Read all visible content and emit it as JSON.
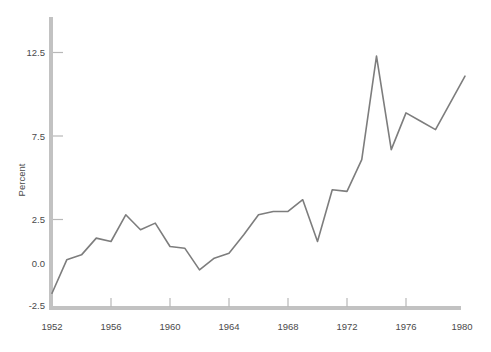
{
  "chart_data": {
    "type": "line",
    "title": "",
    "subtitle": "",
    "xlabel": "",
    "ylabel": "Percent",
    "xlim": [
      1952,
      1981
    ],
    "ylim": [
      -2.5,
      14.2
    ],
    "grid": false,
    "legend": false,
    "legend_position": "none",
    "x_ticks": [
      1952,
      1956,
      1960,
      1964,
      1968,
      1972,
      1976,
      1980
    ],
    "x_tick_labels": [
      "1952",
      "1956",
      "1960",
      "1964",
      "1968",
      "1972",
      "1976",
      "1980"
    ],
    "y_ticks": [
      -2.5,
      0.0,
      2.5,
      7.5,
      12.5
    ],
    "y_tick_labels": [
      "-2.5",
      "0.0",
      "2.5",
      "7.5",
      "12.5"
    ],
    "series": [
      {
        "name": "Percent",
        "color": "#7d7d7d",
        "x": [
          1952,
          1953,
          1954,
          1955,
          1956,
          1957,
          1958,
          1959,
          1960,
          1961,
          1962,
          1963,
          1964,
          1965,
          1966,
          1967,
          1968,
          1969,
          1970,
          1971,
          1972,
          1973,
          1974,
          1975,
          1976,
          1977,
          1978,
          1979,
          1980
        ],
        "values": [
          -1.8,
          0.2,
          0.5,
          1.5,
          1.3,
          2.9,
          2.0,
          2.4,
          1.0,
          0.9,
          -0.4,
          0.3,
          0.6,
          1.7,
          2.9,
          3.1,
          3.1,
          3.8,
          1.3,
          4.4,
          4.3,
          6.2,
          12.4,
          6.8,
          9.0,
          8.5,
          8.0,
          9.6,
          11.2
        ]
      }
    ]
  },
  "axis": {
    "ylabel": "Percent",
    "y_tick_labels": [
      "12.5",
      "7.5",
      "2.5",
      "0.0",
      "-2.5"
    ],
    "x_tick_labels": [
      "1952",
      "1956",
      "1960",
      "1964",
      "1968",
      "1972",
      "1976",
      "1980"
    ]
  },
  "colors": {
    "line": "#7d7d7d",
    "axis": "#b8b8b8",
    "text": "#4a4a4a",
    "background": "#ffffff"
  }
}
